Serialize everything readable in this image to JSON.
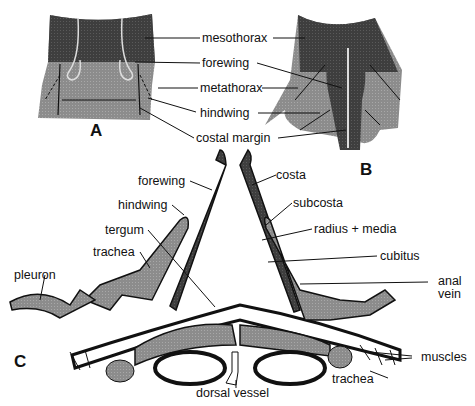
{
  "figure": {
    "panels": {
      "a": "A",
      "b": "B",
      "c": "C"
    },
    "top_labels": {
      "mesothorax": "mesothorax",
      "forewing": "forewing",
      "metathorax": "metathorax",
      "hindwing": "hindwing",
      "costal_margin": "costal margin"
    },
    "section_labels": {
      "forewing": "forewing",
      "hindwing": "hindwing",
      "tergum": "tergum",
      "trachea_left": "trachea",
      "pleuron": "pleuron",
      "costa": "costa",
      "subcosta": "subcosta",
      "radius_media": "radius + media",
      "cubitus": "cubitus",
      "anal_vein_1": "anal",
      "anal_vein_2": "vein",
      "muscles": "muscles",
      "trachea_right": "trachea",
      "dorsal_vessel": "dorsal vessel"
    },
    "colors": {
      "dark": "#3a3a3a",
      "mid": "#8a8a8a",
      "light": "#b5b5b5",
      "line": "#111111"
    }
  }
}
